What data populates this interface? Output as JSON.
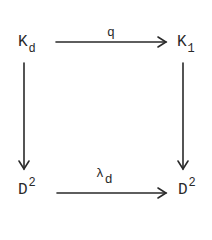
{
  "diagram": {
    "type": "commutative-square",
    "nodes": {
      "top_left": {
        "base": "K",
        "sub": "d"
      },
      "top_right": {
        "base": "K",
        "sub": "1"
      },
      "bottom_left": {
        "base": "D",
        "sup": "2"
      },
      "bottom_right": {
        "base": "D",
        "sup": "2"
      }
    },
    "arrows": {
      "top": {
        "label": "q",
        "from": "top_left",
        "to": "top_right"
      },
      "bottom": {
        "label_base": "λ",
        "label_sub": "d",
        "from": "bottom_left",
        "to": "bottom_right"
      },
      "left": {
        "label": "",
        "from": "top_left",
        "to": "bottom_left"
      },
      "right": {
        "label": "",
        "from": "top_right",
        "to": "bottom_right"
      }
    },
    "stroke_color": "#2a2a2a"
  }
}
